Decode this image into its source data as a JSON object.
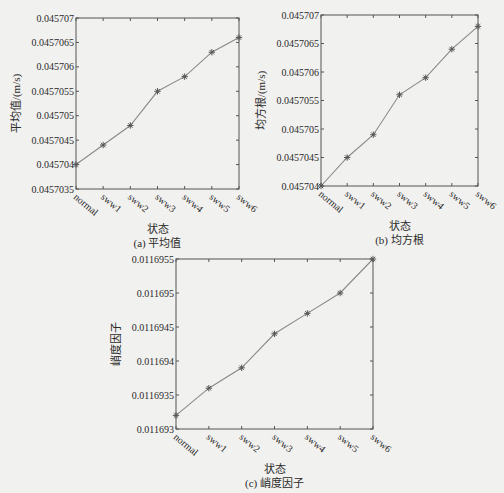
{
  "chart_data": [
    {
      "id": "a",
      "type": "line",
      "title": "",
      "caption": "(a) 平均值",
      "xlabel": "状态",
      "ylabel": "平均值/(m/s)",
      "categories": [
        "normal",
        "sww1",
        "sww2",
        "sww3",
        "sww4",
        "sww5",
        "sww6"
      ],
      "series": [
        {
          "name": "平均值",
          "values": [
            0.045704,
            0.0457044,
            0.0457048,
            0.0457055,
            0.0457058,
            0.0457063,
            0.0457066
          ],
          "marker": "asterisk",
          "color": "#8a8a8a"
        }
      ],
      "yticks": [
        0.0457035,
        0.045704,
        0.0457045,
        0.045705,
        0.0457055,
        0.045706,
        0.0457065,
        0.045707
      ],
      "ytick_labels": [
        "0.0457035",
        "0.045704",
        "0.0457045",
        "0.045705",
        "0.0457055",
        "0.045706",
        "0.0457065",
        "0.045707"
      ],
      "ylim": [
        0.0457035,
        0.045707
      ],
      "grid": false,
      "legend": "none",
      "frame": {
        "left": 76,
        "top": 18,
        "right": 239,
        "bottom": 189
      }
    },
    {
      "id": "b",
      "type": "line",
      "title": "",
      "caption": "(b) 均方根",
      "xlabel": "状态",
      "ylabel": "均方根/(m/s)",
      "categories": [
        "normal",
        "sww1",
        "sww2",
        "sww3",
        "sww4",
        "sww5",
        "sww6"
      ],
      "series": [
        {
          "name": "均方根",
          "values": [
            0.045704,
            0.0457045,
            0.0457049,
            0.0457056,
            0.0457059,
            0.0457064,
            0.0457068
          ],
          "marker": "asterisk",
          "color": "#8a8a8a"
        }
      ],
      "yticks": [
        0.045704,
        0.0457045,
        0.045705,
        0.0457055,
        0.045706,
        0.0457065,
        0.045707
      ],
      "ytick_labels": [
        "0.045704",
        "0.0457045",
        "0.045705",
        "0.0457055",
        "0.045706",
        "0.0457065",
        "0.045707"
      ],
      "ylim": [
        0.045704,
        0.045707
      ],
      "grid": false,
      "legend": "none",
      "frame": {
        "left": 321,
        "top": 15,
        "right": 478,
        "bottom": 186
      }
    },
    {
      "id": "c",
      "type": "line",
      "title": "",
      "caption": "(c) 峭度因子",
      "xlabel": "状态",
      "ylabel": "峭度因子",
      "categories": [
        "normal",
        "sww1",
        "sww2",
        "sww3",
        "sww4",
        "sww5",
        "sww6"
      ],
      "series": [
        {
          "name": "峭度因子",
          "values": [
            0.0116932,
            0.0116936,
            0.0116939,
            0.0116944,
            0.0116947,
            0.011695,
            0.0116955
          ],
          "marker": "asterisk",
          "color": "#8a8a8a"
        }
      ],
      "yticks": [
        0.011693,
        0.0116935,
        0.011694,
        0.0116945,
        0.011695,
        0.0116955
      ],
      "ytick_labels": [
        "0.011693",
        "0.0116935",
        "0.011694",
        "0.0116945",
        "0.011695",
        "0.0116955"
      ],
      "ylim": [
        0.011693,
        0.0116955
      ],
      "grid": false,
      "legend": "none",
      "frame": {
        "left": 176,
        "top": 259,
        "right": 373,
        "bottom": 429
      }
    }
  ]
}
